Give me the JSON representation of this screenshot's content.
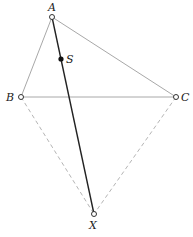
{
  "diagram": {
    "points": {
      "A": {
        "label": "A",
        "x": 52,
        "y": 17
      },
      "B": {
        "label": "B",
        "x": 21,
        "y": 97
      },
      "C": {
        "label": "C",
        "x": 176,
        "y": 97
      },
      "S": {
        "label": "S",
        "x": 61,
        "y": 59
      },
      "X": {
        "label": "X",
        "x": 94,
        "y": 214
      }
    },
    "segments": [
      {
        "from": "A",
        "to": "B",
        "style": "solid-gray"
      },
      {
        "from": "A",
        "to": "C",
        "style": "solid-gray"
      },
      {
        "from": "B",
        "to": "C",
        "style": "solid-gray"
      },
      {
        "from": "A",
        "to": "X",
        "style": "solid-dark"
      },
      {
        "from": "B",
        "to": "X",
        "style": "dashed-gray"
      },
      {
        "from": "C",
        "to": "X",
        "style": "dashed-gray"
      }
    ],
    "colors": {
      "gray_line": "#a8a8a8",
      "dark_line": "#222222",
      "dashed_line": "#b5b5b5"
    }
  }
}
